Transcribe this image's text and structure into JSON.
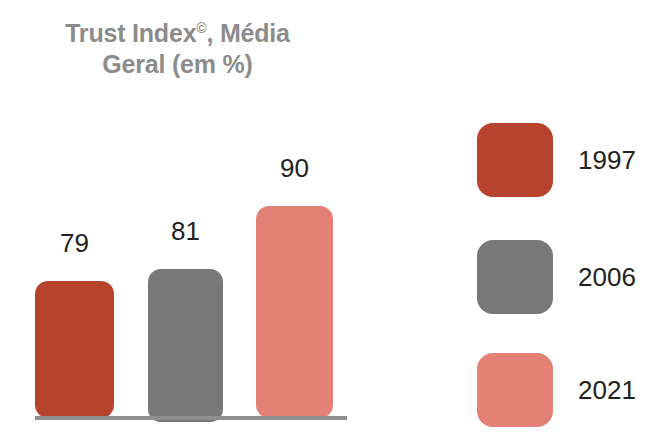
{
  "chart_data": {
    "type": "bar",
    "title": "Trust Index©, Média Geral (em %)",
    "title_lines": [
      "Trust Index",
      "Geral (em %)"
    ],
    "title_superscript": "©",
    "title_line1_tail": ", Média",
    "categories": [
      "1997",
      "2006",
      "2021"
    ],
    "values": [
      79,
      81,
      90
    ],
    "value_labels": [
      "79",
      "81",
      "90"
    ],
    "series": [
      {
        "name": "Trust Index©, Média Geral (em %)",
        "values": [
          79,
          81,
          90
        ]
      }
    ],
    "xlabel": "",
    "ylabel": "",
    "ylim": [
      0,
      100
    ],
    "grid": false,
    "legend_position": "right",
    "legend": [
      {
        "label": "1997",
        "color": "#b7432c"
      },
      {
        "label": "2006",
        "color": "#787878"
      },
      {
        "label": "2021",
        "color": "#e38177"
      }
    ],
    "colors": {
      "bar_1997": "#b7432c",
      "bar_2006": "#787878",
      "bar_2021": "#e38177",
      "title_text": "#8c8c8c",
      "label_text": "#231f20",
      "baseline": "#8d8f91",
      "background": "#ffffff"
    }
  }
}
